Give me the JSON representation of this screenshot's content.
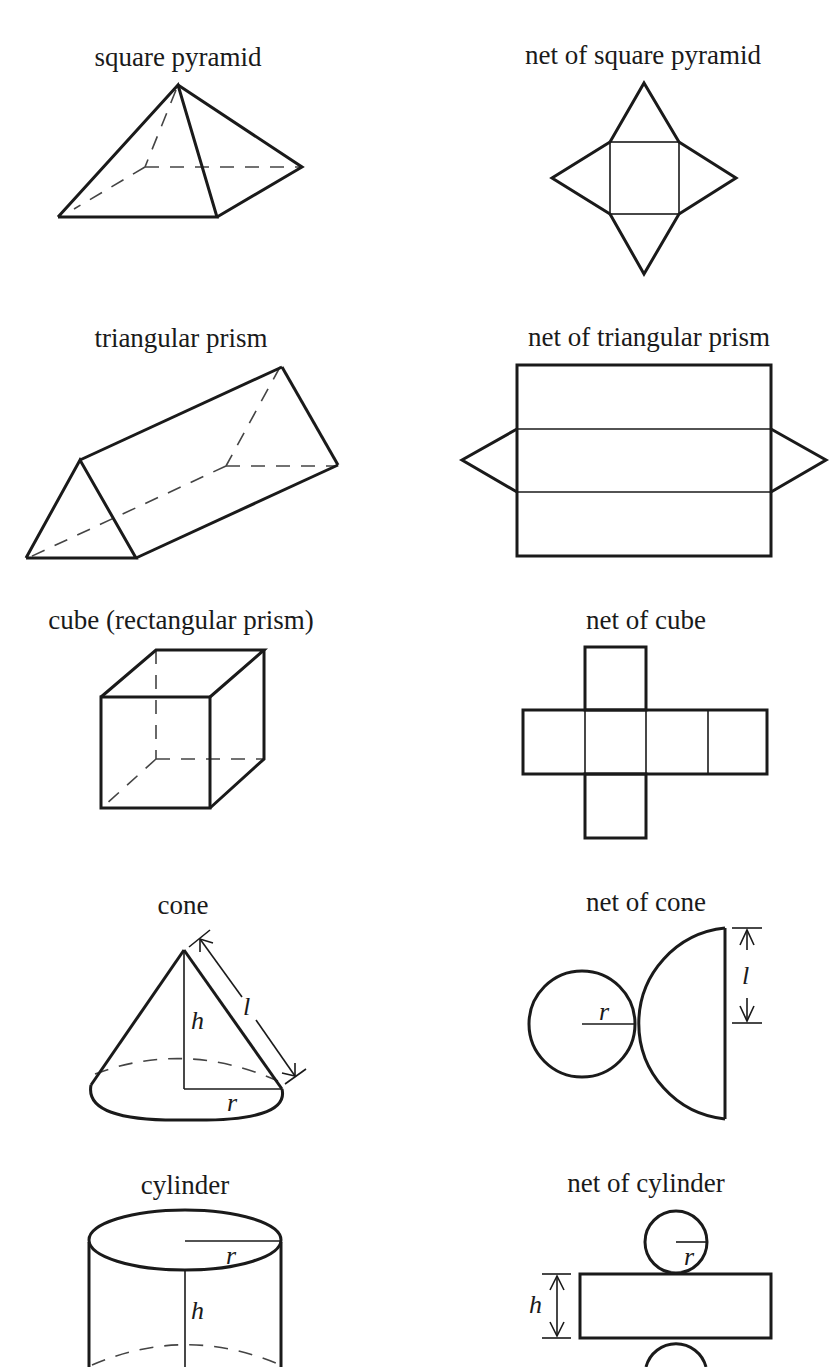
{
  "figure": {
    "rows": [
      {
        "solid": {
          "name": "square-pyramid",
          "label": "square pyramid"
        },
        "net": {
          "name": "net-square-pyramid",
          "label": "net of square pyramid"
        }
      },
      {
        "solid": {
          "name": "triangular-prism",
          "label": "triangular prism"
        },
        "net": {
          "name": "net-triangular-prism",
          "label": "net of triangular prism"
        }
      },
      {
        "solid": {
          "name": "cube",
          "label": "cube (rectangular prism)"
        },
        "net": {
          "name": "net-cube",
          "label": "net of cube"
        }
      },
      {
        "solid": {
          "name": "cone",
          "label": "cone",
          "vars": {
            "height": "h",
            "slant": "l",
            "radius": "r"
          }
        },
        "net": {
          "name": "net-cone",
          "label": "net of cone",
          "vars": {
            "radius": "r",
            "slant": "l"
          }
        }
      },
      {
        "solid": {
          "name": "cylinder",
          "label": "cylinder",
          "vars": {
            "radius": "r",
            "height": "h"
          }
        },
        "net": {
          "name": "net-cylinder",
          "label": "net of cylinder",
          "vars": {
            "radius": "r",
            "height": "h"
          }
        }
      }
    ]
  },
  "colors": {
    "line": "#1a1a1a",
    "hidden_line": "#444444",
    "background": "#ffffff"
  }
}
